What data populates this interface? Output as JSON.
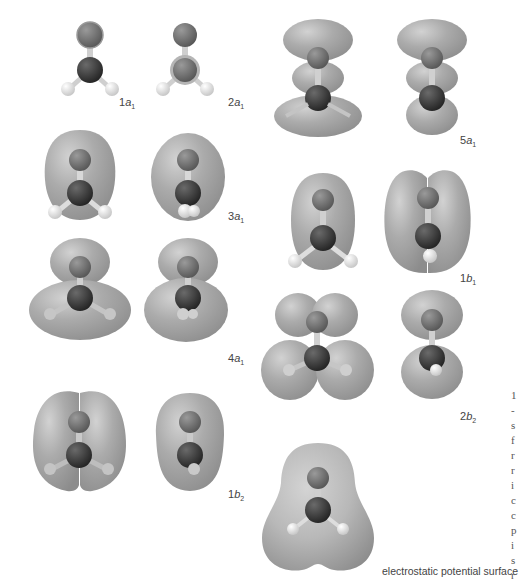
{
  "figure": {
    "molecule": "H2CO",
    "style": "grayscale ball-and-stick with orbital isosurfaces",
    "colors": {
      "background": "#ffffff",
      "lobe_fill": "#a8a8a8",
      "lobe_highlight": "#d0d0d0",
      "lobe_shadow": "#8e8e8e",
      "oxygen_atom": "#6e6e6e",
      "carbon_atom": "#3c3c3c",
      "hydrogen_atom": "#e2e2e2",
      "bond": "#cfcfcf",
      "label_text": "#444444"
    }
  },
  "orbitals": [
    {
      "id": "1a1",
      "number": "1",
      "symbol": "a",
      "subscript": "1"
    },
    {
      "id": "2a1",
      "number": "2",
      "symbol": "a",
      "subscript": "1"
    },
    {
      "id": "3a1",
      "number": "3",
      "symbol": "a",
      "subscript": "1"
    },
    {
      "id": "4a1",
      "number": "4",
      "symbol": "a",
      "subscript": "1"
    },
    {
      "id": "1b2",
      "number": "1",
      "symbol": "b",
      "subscript": "2"
    },
    {
      "id": "5a1",
      "number": "5",
      "symbol": "a",
      "subscript": "1"
    },
    {
      "id": "1b1",
      "number": "1",
      "symbol": "b",
      "subscript": "1"
    },
    {
      "id": "2b2",
      "number": "2",
      "symbol": "b",
      "subscript": "2"
    }
  ],
  "esp": {
    "caption": "electrostatic potential surface"
  },
  "edge_text": {
    "chars": [
      "1",
      "-",
      "s",
      "f",
      "r",
      "r",
      "i",
      "c",
      "c",
      "p",
      "i",
      "s",
      "r"
    ]
  }
}
